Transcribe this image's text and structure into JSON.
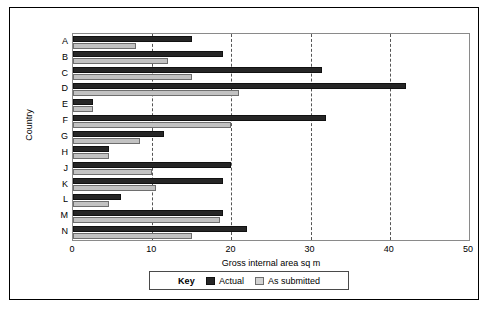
{
  "chart_data": {
    "type": "bar",
    "orientation": "horizontal",
    "title": "",
    "xlabel": "Gross internal area sq m",
    "ylabel": "Country",
    "categories": [
      "A",
      "B",
      "C",
      "D",
      "E",
      "F",
      "G",
      "H",
      "J",
      "K",
      "L",
      "M",
      "N"
    ],
    "xlim": [
      0,
      50
    ],
    "xticks": [
      0,
      10,
      20,
      30,
      40,
      50
    ],
    "grid": "vertical-dashed",
    "legend": {
      "title": "Key",
      "position": "bottom",
      "entries": [
        "Actual",
        "As submitted"
      ]
    },
    "series": [
      {
        "name": "Actual",
        "color": "#262626",
        "values": [
          15,
          19,
          31.5,
          42,
          2.5,
          32,
          11.5,
          4.5,
          20,
          19,
          6,
          19,
          22
        ]
      },
      {
        "name": "As submitted",
        "color": "#c2c2c2",
        "values": [
          8,
          12,
          15,
          21,
          2.5,
          20,
          8.5,
          4.5,
          10,
          10.5,
          4.5,
          18.5,
          15
        ]
      }
    ]
  },
  "legend": {
    "key_label": "Key",
    "actual_label": "Actual",
    "submitted_label": "As submitted"
  },
  "axes": {
    "x_title": "Gross internal area sq m",
    "y_title": "Country",
    "x_tick_labels": [
      "0",
      "10",
      "20",
      "30",
      "40",
      "50"
    ],
    "y_tick_labels": [
      "A",
      "B",
      "C",
      "D",
      "E",
      "F",
      "G",
      "H",
      "J",
      "K",
      "L",
      "M",
      "N"
    ]
  }
}
